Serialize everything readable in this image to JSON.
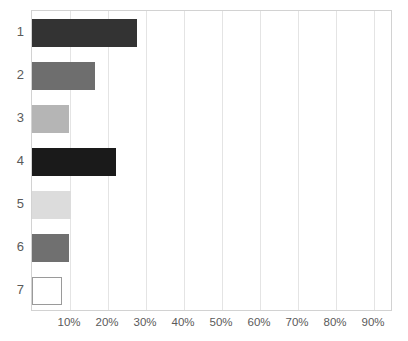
{
  "chart_data": {
    "type": "bar",
    "orientation": "horizontal",
    "title": "",
    "xlabel": "",
    "ylabel": "",
    "categories": [
      "1",
      "2",
      "3",
      "4",
      "5",
      "6",
      "7"
    ],
    "values": [
      27.5,
      16.5,
      9.7,
      22.0,
      10.3,
      9.7,
      8.0
    ],
    "value_format": "percent",
    "xlim": [
      0,
      95
    ],
    "xticks": [
      10,
      20,
      30,
      40,
      50,
      60,
      70,
      80,
      90
    ],
    "xtick_labels": [
      "10%",
      "20%",
      "30%",
      "40%",
      "50%",
      "60%",
      "70%",
      "80%",
      "90%"
    ],
    "grid": "vertical",
    "legend": "none",
    "bar_colors": [
      "#333333",
      "#6e6e6e",
      "#b5b5b5",
      "#1a1a1a",
      "#dcdcdc",
      "#707070",
      "#ffffff"
    ],
    "bar_border_colors": [
      "#333333",
      "#6e6e6e",
      "#b5b5b5",
      "#1a1a1a",
      "#dcdcdc",
      "#707070",
      "#9a9a9a"
    ],
    "bars": [
      {
        "category": "1",
        "value": 27.5,
        "label": "27.5%",
        "color": "#333333",
        "border": "#333333"
      },
      {
        "category": "2",
        "value": 16.5,
        "label": "16.5%",
        "color": "#6e6e6e",
        "border": "#6e6e6e"
      },
      {
        "category": "3",
        "value": 9.7,
        "label": "9.7%",
        "color": "#b5b5b5",
        "border": "#b5b5b5"
      },
      {
        "category": "4",
        "value": 22.0,
        "label": "22%",
        "color": "#1a1a1a",
        "border": "#1a1a1a"
      },
      {
        "category": "5",
        "value": 10.3,
        "label": "10.3%",
        "color": "#dcdcdc",
        "border": "#dcdcdc"
      },
      {
        "category": "6",
        "value": 9.7,
        "label": "9.7%",
        "color": "#707070",
        "border": "#707070"
      },
      {
        "category": "7",
        "value": 8.0,
        "label": "8%",
        "color": "#ffffff",
        "border": "#9a9a9a"
      }
    ]
  },
  "axis": {
    "plot_background": "#ffffff",
    "frame_color": "#d2d2d2",
    "gridline_color": "#e4e4e4",
    "tick_text_color": "#5a5a5a"
  }
}
